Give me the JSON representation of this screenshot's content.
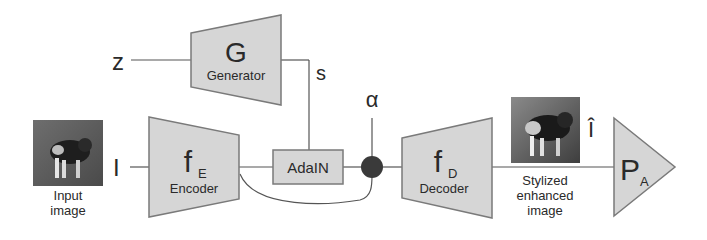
{
  "diagram": {
    "inputs": {
      "z_label": "z",
      "s_label": "s",
      "alpha_label": "α",
      "i_label": "I",
      "ihat_label": "Î"
    },
    "generator": {
      "symbol": "G",
      "name": "Generator"
    },
    "encoder": {
      "symbol": "f",
      "subscript": "E",
      "name": "Encoder"
    },
    "adain": {
      "name": "AdaIN"
    },
    "decoder": {
      "symbol": "f",
      "subscript": "D",
      "name": "Decoder"
    },
    "predictor": {
      "symbol": "P",
      "subscript": "A"
    },
    "input_image": {
      "caption_line1": "Input",
      "caption_line2": "image"
    },
    "output_image": {
      "caption_line1": "Stylized",
      "caption_line2": "enhanced",
      "caption_line3": "image"
    },
    "colors": {
      "block_fill": "#d6d6d6",
      "block_stroke": "#7a7a7a",
      "line": "#555555",
      "mixer": "#3a3a3a",
      "text": "#2a2a2a"
    }
  }
}
